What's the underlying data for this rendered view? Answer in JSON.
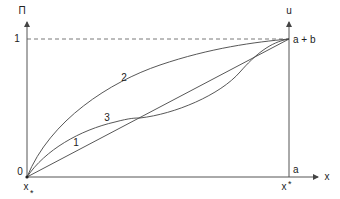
{
  "diagram": {
    "left_axis_label": "Π",
    "right_axis_label": "u",
    "x_axis_label": "x",
    "left_tick_top": "1",
    "left_tick_bottom": "0",
    "right_tick_top": "a + b",
    "right_tick_bottom": "a",
    "x_left_label": "x",
    "x_left_sub": "*",
    "x_right_label": "x",
    "x_right_sup": "*",
    "curves": [
      {
        "id": "1",
        "label": "1",
        "description": "straight line from origin to (1, a+b)"
      },
      {
        "id": "2",
        "label": "2",
        "description": "concave curve above line 1"
      },
      {
        "id": "3",
        "label": "3",
        "description": "S-shaped curve crossing line 1 twice"
      }
    ],
    "colors": {
      "line": "#444444",
      "axis": "#555555",
      "text": "#222222"
    }
  }
}
